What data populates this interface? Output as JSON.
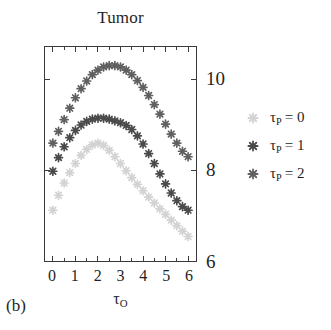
{
  "panel_label": "(b)",
  "chart_data": {
    "type": "scatter",
    "title": "Tumor",
    "xlabel": "τ_O",
    "xlabel_base": "τ",
    "xlabel_sub": "O",
    "ylabel": "",
    "xlim": [
      -0.35,
      6.35
    ],
    "ylim": [
      6,
      10.72
    ],
    "grid": false,
    "legend_position": "right",
    "x_ticks": [
      0,
      1,
      2,
      3,
      4,
      5,
      6
    ],
    "x_tick_labels": [
      "0",
      "1",
      "2",
      "3",
      "4",
      "5",
      "6"
    ],
    "x_minor_ticks": [
      0.5,
      1.5,
      2.5,
      3.5,
      4.5,
      5.5
    ],
    "y_ticks": [
      6,
      8,
      10
    ],
    "y_tick_labels": [
      "6",
      "8",
      "10"
    ],
    "y_axis_side": "right",
    "marker": "asterisk-8-point",
    "series": [
      {
        "name": "τ_P = 0",
        "legend_base": "τ",
        "legend_sub": "P",
        "legend_value": "= 0",
        "color": "#d3d3d3",
        "x": [
          0,
          0.25,
          0.5,
          0.75,
          1,
          1.25,
          1.5,
          1.75,
          2,
          2.25,
          2.5,
          2.75,
          3,
          3.25,
          3.5,
          3.75,
          4,
          4.25,
          4.5,
          4.75,
          5,
          5.25,
          5.5,
          5.75,
          6
        ],
        "values": [
          7.12,
          7.45,
          7.72,
          7.95,
          8.15,
          8.33,
          8.46,
          8.56,
          8.6,
          8.55,
          8.44,
          8.3,
          8.15,
          7.99,
          7.84,
          7.69,
          7.55,
          7.41,
          7.28,
          7.15,
          7.03,
          6.9,
          6.78,
          6.66,
          6.54
        ]
      },
      {
        "name": "τ_P = 1",
        "legend_base": "τ",
        "legend_sub": "P",
        "legend_value": "= 1",
        "color": "#4a4a4a",
        "x": [
          0,
          0.25,
          0.5,
          0.75,
          1,
          1.25,
          1.5,
          1.75,
          2,
          2.25,
          2.5,
          2.75,
          3,
          3.25,
          3.5,
          3.75,
          4,
          4.25,
          4.5,
          4.75,
          5,
          5.25,
          5.5,
          5.75,
          6
        ],
        "values": [
          7.98,
          8.28,
          8.52,
          8.72,
          8.88,
          9.0,
          9.08,
          9.13,
          9.15,
          9.15,
          9.13,
          9.09,
          9.05,
          8.99,
          8.9,
          8.76,
          8.58,
          8.37,
          8.15,
          7.92,
          7.7,
          7.5,
          7.33,
          7.2,
          7.12
        ]
      },
      {
        "name": "τ_P = 2",
        "legend_base": "τ",
        "legend_sub": "P",
        "legend_value": "= 2",
        "color": "#606060",
        "x": [
          0,
          0.25,
          0.5,
          0.75,
          1,
          1.25,
          1.5,
          1.75,
          2,
          2.25,
          2.5,
          2.75,
          3,
          3.25,
          3.5,
          3.75,
          4,
          4.25,
          4.5,
          4.75,
          5,
          5.25,
          5.5,
          5.75,
          6
        ],
        "values": [
          8.6,
          8.86,
          9.12,
          9.37,
          9.6,
          9.8,
          9.97,
          10.11,
          10.21,
          10.28,
          10.31,
          10.31,
          10.28,
          10.21,
          10.11,
          9.98,
          9.83,
          9.65,
          9.45,
          9.24,
          9.02,
          8.8,
          8.6,
          8.42,
          8.3
        ]
      }
    ]
  },
  "axis_style": {
    "frame_color": "#3a3a3a",
    "tick_color": "#3a3a3a"
  }
}
